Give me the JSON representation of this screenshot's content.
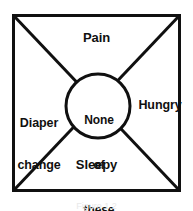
{
  "figure": {
    "type": "quadrant-diagram",
    "shape": "square-with-diagonals-and-center-circle",
    "caption": "Figure 1.2",
    "colors": {
      "stroke": "#101010",
      "background": "#ffffff",
      "text": "#101010"
    },
    "geometry": {
      "box": {
        "x": 12,
        "y": 14,
        "width": 169,
        "height": 178
      },
      "circle": {
        "cx": 98,
        "cy": 106,
        "r": 33
      },
      "stroke_width": 3
    },
    "center": {
      "line1": "None",
      "line2": "of",
      "line3": "these"
    },
    "quadrants": [
      {
        "position": "top",
        "label": "Pain"
      },
      {
        "position": "right",
        "label": "Hungry"
      },
      {
        "position": "bottom",
        "label": "Sleepy"
      },
      {
        "position": "left",
        "line1": "Diaper",
        "line2": "change"
      }
    ]
  }
}
